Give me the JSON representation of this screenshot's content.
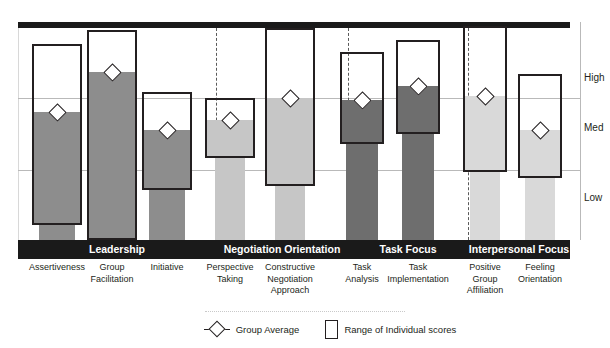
{
  "axis": {
    "y_tick_labels": [
      "High",
      "Med",
      "Low"
    ],
    "y_tick_tops": [
      72,
      122,
      192
    ]
  },
  "legend": {
    "group_average_label": "Group Average",
    "range_label": "Range of Individual scores",
    "diamond_icon": "diamond-marker-icon",
    "box_icon": "range-box-icon"
  },
  "groups": [
    {
      "label": "Leadership",
      "left": 18,
      "width": 198,
      "color": "#8d8d8d"
    },
    {
      "label": "Negotiation Orientation",
      "left": 216,
      "width": 132,
      "color": "#c6c6c6"
    },
    {
      "label": "Task Focus",
      "left": 348,
      "width": 120,
      "color": "#6e6e6e"
    },
    {
      "label": "Interpersonal Focus",
      "left": 468,
      "width": 102,
      "color": "#d9d9d9"
    }
  ],
  "separators": [
    216,
    348,
    468
  ],
  "chart_data": {
    "type": "bar",
    "title": "",
    "xlabel": "",
    "ylabel": "",
    "grid": true,
    "legend_position": "bottom-center",
    "ylim": [
      0,
      100
    ],
    "y_category_labels": [
      "High",
      "Med",
      "Low"
    ],
    "group_names": [
      "Leadership",
      "Negotiation Orientation",
      "Task Focus",
      "Interpersonal Focus"
    ],
    "series": [
      {
        "name": "Group Average",
        "marker": "diamond"
      },
      {
        "name": "Range of Individual scores",
        "marker": "box"
      }
    ],
    "categories": [
      "Assertiveness",
      "Group Facilitation",
      "Initiative",
      "Perspective Taking",
      "Constructive Negotiation Approach",
      "Task Analysis",
      "Task Implementation",
      "Positive Group Affiliation",
      "Feeling Orientation"
    ],
    "points": [
      {
        "category": "Assertiveness",
        "group": "Leadership",
        "label_lines": [
          "Assertiveness"
        ],
        "center_x": 57,
        "bar_width": 36,
        "box_width": 50,
        "avg_top": 112,
        "range_top": 44,
        "range_bottom": 225,
        "avg": 58,
        "range_low": 7,
        "range_high": 91,
        "bar_color": "#8d8d8d"
      },
      {
        "category": "Group Facilitation",
        "group": "Leadership",
        "label_lines": [
          "Group",
          "Facilitation"
        ],
        "center_x": 112,
        "bar_width": 36,
        "box_width": 50,
        "avg_top": 72,
        "range_top": 30,
        "range_bottom": 240,
        "avg": 77,
        "range_low": 0,
        "range_high": 97,
        "bar_color": "#8d8d8d"
      },
      {
        "category": "Initiative",
        "group": "Leadership",
        "label_lines": [
          "Initiative"
        ],
        "center_x": 167,
        "bar_width": 36,
        "box_width": 50,
        "avg_top": 130,
        "range_top": 92,
        "range_bottom": 190,
        "avg": 50,
        "range_low": 23,
        "range_high": 68,
        "bar_color": "#8d8d8d"
      },
      {
        "category": "Perspective Taking",
        "group": "Negotiation Orientation",
        "label_lines": [
          "Perspective",
          "Taking"
        ],
        "center_x": 230,
        "bar_width": 30,
        "box_width": 50,
        "avg_top": 120,
        "range_top": 98,
        "range_bottom": 158,
        "avg": 56,
        "range_low": 38,
        "range_high": 65,
        "bar_color": "#c6c6c6"
      },
      {
        "category": "Constructive Negotiation Approach",
        "group": "Negotiation Orientation",
        "label_lines": [
          "Constructive",
          "Negotiation",
          "Approach"
        ],
        "center_x": 290,
        "bar_width": 30,
        "box_width": 50,
        "avg_top": 98,
        "range_top": 28,
        "range_bottom": 186,
        "avg": 66,
        "range_low": 25,
        "range_high": 98,
        "bar_color": "#c6c6c6"
      },
      {
        "category": "Task Analysis",
        "group": "Task Focus",
        "label_lines": [
          "Task",
          "Analysis"
        ],
        "center_x": 362,
        "bar_width": 32,
        "box_width": 44,
        "avg_top": 100,
        "range_top": 52,
        "range_bottom": 144,
        "avg": 65,
        "range_low": 44,
        "range_high": 87,
        "bar_color": "#6e6e6e"
      },
      {
        "category": "Task Implementation",
        "group": "Task Focus",
        "label_lines": [
          "Task",
          "Implementation"
        ],
        "center_x": 418,
        "bar_width": 32,
        "box_width": 44,
        "avg_top": 86,
        "range_top": 40,
        "range_bottom": 134,
        "avg": 71,
        "range_low": 48,
        "range_high": 92,
        "bar_color": "#6e6e6e"
      },
      {
        "category": "Positive Group Affiliation",
        "group": "Interpersonal Focus",
        "label_lines": [
          "Positive",
          "Group",
          "Affiliation"
        ],
        "center_x": 485,
        "bar_width": 30,
        "box_width": 44,
        "avg_top": 96,
        "range_top": 26,
        "range_bottom": 172,
        "avg": 67,
        "range_low": 32,
        "range_high": 99,
        "bar_color": "#d9d9d9"
      },
      {
        "category": "Feeling Orientation",
        "group": "Interpersonal Focus",
        "label_lines": [
          "Feeling",
          "Orientation"
        ],
        "center_x": 540,
        "bar_width": 30,
        "box_width": 44,
        "avg_top": 130,
        "range_top": 74,
        "range_bottom": 178,
        "avg": 51,
        "range_low": 30,
        "range_high": 78,
        "bar_color": "#d9d9d9"
      }
    ]
  }
}
